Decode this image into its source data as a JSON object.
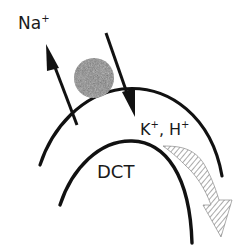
{
  "diagram": {
    "labels": {
      "sodium_ion": "Na",
      "sodium_charge": "+",
      "potassium_ion": "K",
      "potassium_charge": "+",
      "separator": ", ",
      "hydrogen_ion": "H",
      "hydrogen_charge": "+",
      "tubule": "DCT"
    },
    "elements": [
      {
        "name": "outer-membrane-arc",
        "type": "arc"
      },
      {
        "name": "inner-lumen-arc",
        "type": "arc"
      },
      {
        "name": "transporter-channel",
        "type": "circle",
        "fill": "stippled gray"
      },
      {
        "name": "sodium-reabsorption-arrow",
        "direction": "up-left"
      },
      {
        "name": "secretion-arrow",
        "direction": "down-right"
      },
      {
        "name": "hatched-flow-arrow",
        "direction": "downstream along tubule"
      }
    ],
    "colors": {
      "line": "#111111",
      "channel_fill": "#8a8a8a",
      "hatch": "#555555"
    }
  }
}
